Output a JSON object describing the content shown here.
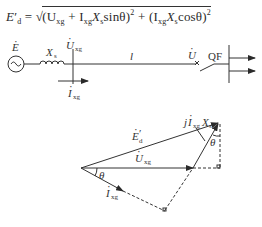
{
  "formula": {
    "lhs": "E'd",
    "lhs_main": "E",
    "lhs_prime": "′",
    "lhs_sub": "d",
    "equals": "=",
    "sqrt": "√",
    "term1_open": "(U",
    "term1_U_sub": "xg",
    "term1_plus": " + I",
    "term1_I_sub": "xg",
    "term1_X": "X",
    "term1_X_sub": "s",
    "term1_fn": "sinθ)",
    "term1_exp": "2",
    "plus": " + ",
    "term2_open": "(I",
    "term2_I_sub": "xg",
    "term2_X": "X",
    "term2_X_sub": "s",
    "term2_fn": "cosθ)",
    "term2_exp": "2",
    "full_text": "E'd = √((Uxg + Ixg Xs sinθ)² + (Ixg Xs cosθ)²)"
  },
  "circuit": {
    "source_label": "E",
    "source_symbol": "~",
    "reactance_label": "X",
    "reactance_sub": "s",
    "bus_voltage_label": "U",
    "bus_voltage_sub": "xg",
    "current_label": "I",
    "current_sub": "xg",
    "line_label": "l",
    "load_voltage_label": "U",
    "breaker_label": "QF",
    "fault_mark": "×"
  },
  "phasor": {
    "emf_label": "E",
    "emf_prime": "′",
    "emf_sub": "d",
    "voltage_label": "U",
    "voltage_sub": "xg",
    "current_label": "I",
    "current_sub": "xg",
    "drop_label_j": "j",
    "drop_label_I": "I",
    "drop_label_I_sub": "xg",
    "drop_label_X": "X",
    "drop_label_X_sub": "s",
    "angle_label_origin": "θ",
    "angle_label_tip": "θ"
  },
  "colors": {
    "ink": "#2a2a2a",
    "background": "#ffffff"
  }
}
